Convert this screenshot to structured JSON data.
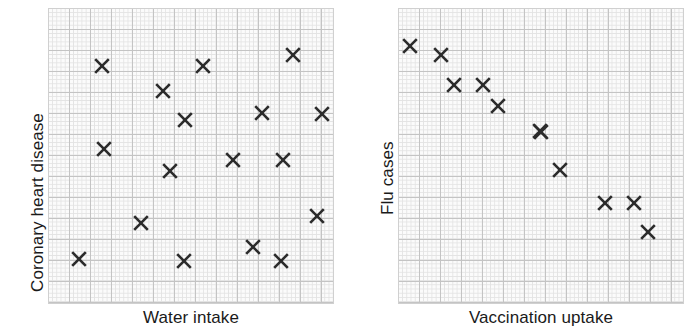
{
  "figure": {
    "background_color": "#ffffff",
    "marker_color": "#2b2b2b",
    "grid_minor_color": "#e3e3e3",
    "grid_major_color": "#c4c4c4",
    "plot_background_color": "#fbfbfb"
  },
  "chart_data": [
    {
      "type": "scatter",
      "title": "",
      "xlabel": "Water intake",
      "ylabel": "Coronary heart disease",
      "grid": true,
      "grid_style": "graph-paper",
      "legend": "none",
      "xlim": [
        0,
        100
      ],
      "ylim": [
        0,
        100
      ],
      "axis_ticks": "none",
      "marker": "x",
      "relationship": "no correlation",
      "n_points": 16,
      "points": [
        {
          "x": 19.0,
          "y": 80.5
        },
        {
          "x": 40.3,
          "y": 72.0
        },
        {
          "x": 47.8,
          "y": 62.2
        },
        {
          "x": 54.0,
          "y": 85.0
        },
        {
          "x": 71.4,
          "y": 88.6
        },
        {
          "x": 63.4,
          "y": 65.8
        },
        {
          "x": 88.4,
          "y": 65.5
        },
        {
          "x": 19.7,
          "y": 53.7
        },
        {
          "x": 42.8,
          "y": 46.3
        },
        {
          "x": 64.8,
          "y": 50.0
        },
        {
          "x": 82.1,
          "y": 50.0
        },
        {
          "x": 32.6,
          "y": 34.5
        },
        {
          "x": 94.0,
          "y": 36.8
        },
        {
          "x": 71.7,
          "y": 25.5
        },
        {
          "x": 10.8,
          "y": 21.4
        },
        {
          "x": 47.5,
          "y": 22.1
        },
        {
          "x": 81.0,
          "y": 21.4
        }
      ]
    },
    {
      "type": "scatter",
      "title": "",
      "xlabel": "Vaccination uptake",
      "ylabel": "Flu cases",
      "grid": true,
      "grid_style": "graph-paper",
      "legend": "none",
      "xlim": [
        0,
        100
      ],
      "ylim": [
        0,
        100
      ],
      "axis_ticks": "none",
      "marker": "x",
      "relationship": "negative correlation",
      "n_points": 11,
      "points": [
        {
          "x": 5.5,
          "y": 92.2
        },
        {
          "x": 16.6,
          "y": 89.1
        },
        {
          "x": 21.2,
          "y": 78.9
        },
        {
          "x": 31.5,
          "y": 78.9
        },
        {
          "x": 36.9,
          "y": 71.8
        },
        {
          "x": 51.5,
          "y": 63.3
        },
        {
          "x": 52.2,
          "y": 63.0
        },
        {
          "x": 58.9,
          "y": 50.0
        },
        {
          "x": 75.0,
          "y": 38.8
        },
        {
          "x": 85.3,
          "y": 38.8
        },
        {
          "x": 90.3,
          "y": 28.9
        }
      ]
    }
  ],
  "charts": [
    {
      "id": "chart-coronary-heart-disease",
      "xlabel": "Water intake",
      "ylabel": "Coronary heart disease",
      "plot": {
        "left": 48,
        "top": 8,
        "width": 286,
        "height": 296
      },
      "label_x": {
        "left": 48,
        "top": 308,
        "width": 286
      },
      "label_y": {
        "left": 28,
        "top": 292
      },
      "points_px": [
        {
          "x": 102,
          "y": 66
        },
        {
          "x": 163,
          "y": 91
        },
        {
          "x": 185,
          "y": 120
        },
        {
          "x": 203,
          "y": 66
        },
        {
          "x": 293,
          "y": 55
        },
        {
          "x": 262,
          "y": 113
        },
        {
          "x": 322,
          "y": 114
        },
        {
          "x": 104,
          "y": 149
        },
        {
          "x": 170,
          "y": 171
        },
        {
          "x": 233,
          "y": 160
        },
        {
          "x": 283,
          "y": 160
        },
        {
          "x": 141,
          "y": 223
        },
        {
          "x": 317,
          "y": 216
        },
        {
          "x": 253,
          "y": 247
        },
        {
          "x": 79,
          "y": 259
        },
        {
          "x": 184,
          "y": 261
        },
        {
          "x": 281,
          "y": 261
        }
      ]
    },
    {
      "id": "chart-flu-cases",
      "xlabel": "Vaccination uptake",
      "ylabel": "Flu cases",
      "plot": {
        "left": 398,
        "top": 8,
        "width": 286,
        "height": 296
      },
      "label_x": {
        "left": 398,
        "top": 308,
        "width": 286
      },
      "label_y": {
        "left": 378,
        "top": 215
      },
      "points_px": [
        {
          "x": 410,
          "y": 46
        },
        {
          "x": 441,
          "y": 55
        },
        {
          "x": 454,
          "y": 85
        },
        {
          "x": 483,
          "y": 85
        },
        {
          "x": 498,
          "y": 106
        },
        {
          "x": 540,
          "y": 131
        },
        {
          "x": 541,
          "y": 132
        },
        {
          "x": 560,
          "y": 170
        },
        {
          "x": 605,
          "y": 203
        },
        {
          "x": 634,
          "y": 203
        },
        {
          "x": 648,
          "y": 232
        }
      ]
    }
  ]
}
